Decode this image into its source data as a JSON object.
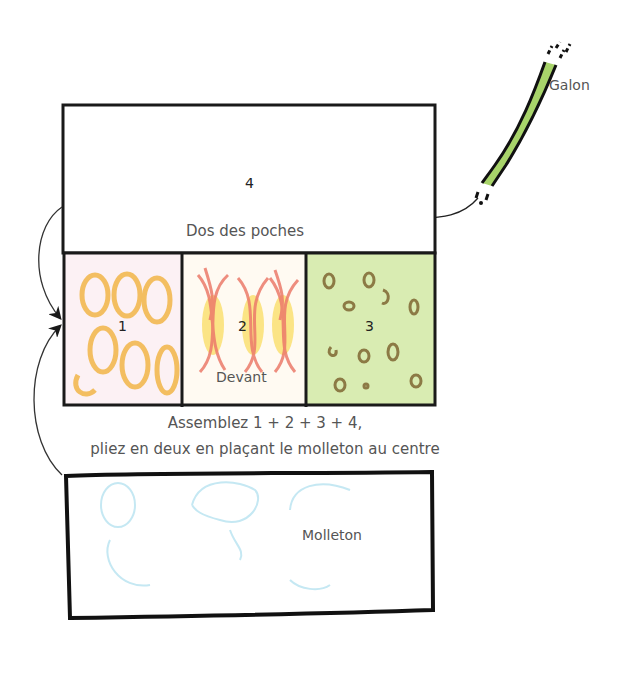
{
  "diagram": {
    "galon": {
      "label": "Galon",
      "color": "#a8d46a"
    },
    "panel_4": {
      "number": "4",
      "label": "Dos des poches"
    },
    "panels_front": [
      {
        "number": "1",
        "fill": "#fbe3b0",
        "pattern": "orange-circles",
        "pattern_color": "#f2b648"
      },
      {
        "number": "2",
        "fill": "#fdf0d0",
        "pattern": "red-yellow-flames",
        "pattern_color": "#ef7f6a"
      },
      {
        "number": "3",
        "fill": "#d8ecb0",
        "pattern": "brown-dots",
        "pattern_color": "#9b8450"
      }
    ],
    "front_label": "Devant",
    "instruction_line1": "Assemblez 1 + 2 + 3 + 4,",
    "instruction_line2": "pliez en deux en plaçant le molleton au centre",
    "molleton": {
      "label": "Molleton",
      "pattern_color": "#bfe6f2"
    },
    "stroke_color": "#1a1a1a"
  }
}
